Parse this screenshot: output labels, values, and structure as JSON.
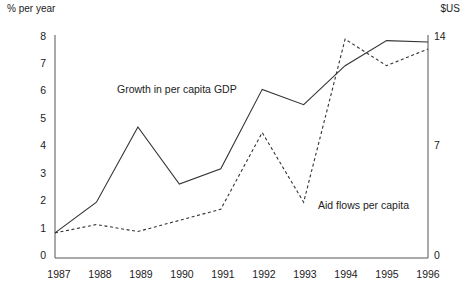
{
  "axes": {
    "left_caption": "% per year",
    "right_caption": "$US",
    "left_ticks": [
      "8",
      "7",
      "6",
      "5",
      "4",
      "3",
      "2",
      "1",
      "0"
    ],
    "right_ticks": [
      "14",
      "7",
      "0"
    ],
    "x_ticks": [
      "1987",
      "1988",
      "1989",
      "1990",
      "1991",
      "1992",
      "1993",
      "1994",
      "1995",
      "1996"
    ]
  },
  "labels": {
    "gdp": "Growth in per capita GDP",
    "aid": "Aid flows per capita"
  },
  "colors": {
    "line": "#333333",
    "axis": "#555555",
    "text": "#222222"
  },
  "chart_data": {
    "type": "line",
    "title": "",
    "xlabel": "",
    "ylabel": "% per year",
    "y2label": "$US",
    "grid": false,
    "legend": "inline-annotation",
    "x": [
      1987,
      1988,
      1989,
      1990,
      1991,
      1992,
      1993,
      1994,
      1995,
      1996
    ],
    "categories": [
      "1987",
      "1988",
      "1989",
      "1990",
      "1991",
      "1992",
      "1993",
      "1994",
      "1995",
      "1996"
    ],
    "ylim": [
      0,
      8
    ],
    "y2lim": [
      0,
      14
    ],
    "yticks": [
      0,
      1,
      2,
      3,
      4,
      5,
      6,
      7,
      8
    ],
    "y2ticks": [
      0,
      7,
      14
    ],
    "series": [
      {
        "name": "Growth in per capita GDP",
        "axis": "left",
        "unit": "% per year",
        "style": "solid",
        "values": [
          0.9,
          2.0,
          4.7,
          2.65,
          3.2,
          6.05,
          5.5,
          6.9,
          7.8,
          7.75
        ]
      },
      {
        "name": "Aid flows per capita",
        "axis": "right",
        "unit": "$US",
        "style": "dashed",
        "values_left_scale": [
          0.9,
          1.2,
          0.95,
          1.35,
          1.75,
          4.5,
          2.0,
          7.85,
          6.9,
          7.5
        ],
        "values": [
          1.58,
          2.1,
          1.66,
          2.36,
          3.06,
          7.88,
          3.5,
          13.74,
          12.08,
          13.13
        ]
      }
    ]
  }
}
